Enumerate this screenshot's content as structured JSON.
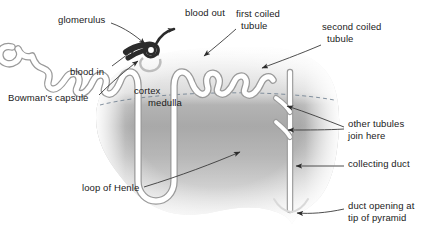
{
  "diagram": {
    "colors": {
      "tubule": "#ffffff",
      "tubule_outline": "#8d8d8d",
      "glomerulus": "#2b2b2b",
      "cortex": "#d8d8d8",
      "medulla": "#8f8f8f",
      "text": "#1a1a1a",
      "leader": "#3a3a3a",
      "background": "#ffffff"
    },
    "regions": [
      {
        "name": "cortex",
        "label": "cortex"
      },
      {
        "name": "medulla",
        "label": "medulla"
      }
    ],
    "labels": [
      {
        "id": "glomerulus",
        "text": "glomerulus",
        "x": 58,
        "y": 18
      },
      {
        "id": "blood-out",
        "text": "blood out",
        "x": 185,
        "y": 11
      },
      {
        "id": "first-coiled",
        "text": "first coiled",
        "x": 236,
        "y": 12
      },
      {
        "id": "first-coiled-2",
        "text": "tubule",
        "x": 241,
        "y": 24
      },
      {
        "id": "second-coiled",
        "text": "second coiled",
        "x": 322,
        "y": 25
      },
      {
        "id": "second-coiled-2",
        "text": "tubule",
        "x": 327,
        "y": 37
      },
      {
        "id": "blood-in",
        "text": "blood in",
        "x": 70,
        "y": 70
      },
      {
        "id": "bowmans-capsule",
        "text": "Bowman's capsule",
        "x": 8,
        "y": 96
      },
      {
        "id": "cortex",
        "text": "cortex",
        "x": 134,
        "y": 89
      },
      {
        "id": "medulla",
        "text": "medulla",
        "x": 148,
        "y": 101
      },
      {
        "id": "other-tubules",
        "text": "other tubules",
        "x": 348,
        "y": 122
      },
      {
        "id": "other-tubules-2",
        "text": "join here",
        "x": 348,
        "y": 134
      },
      {
        "id": "collecting-duct",
        "text": "collecting duct",
        "x": 348,
        "y": 162
      },
      {
        "id": "loop-of-henle",
        "text": "loop of Henle",
        "x": 82,
        "y": 186
      },
      {
        "id": "duct-opening",
        "text": "duct opening at",
        "x": 348,
        "y": 204
      },
      {
        "id": "duct-opening-2",
        "text": "tip of pyramid",
        "x": 348,
        "y": 216
      }
    ],
    "structures": [
      {
        "name": "glomerulus",
        "type": "capillary-knot"
      },
      {
        "name": "bowmans-capsule",
        "type": "cup"
      },
      {
        "name": "first-coiled-tubule",
        "type": "convoluted-tubule"
      },
      {
        "name": "loop-of-henle",
        "type": "hairpin-loop"
      },
      {
        "name": "second-coiled-tubule",
        "type": "convoluted-tubule"
      },
      {
        "name": "collecting-duct",
        "type": "duct"
      },
      {
        "name": "afferent-arteriole",
        "type": "vessel"
      },
      {
        "name": "efferent-arteriole",
        "type": "vessel"
      }
    ]
  }
}
